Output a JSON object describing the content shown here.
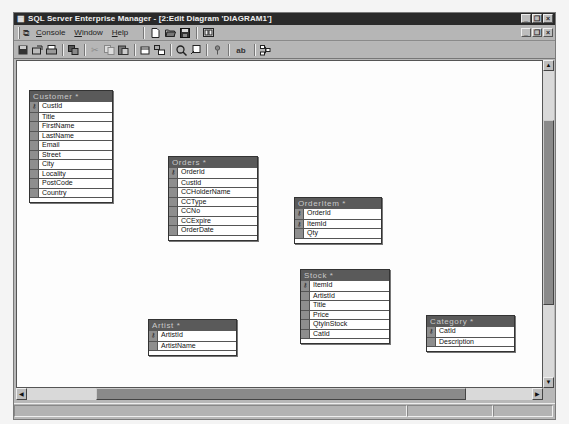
{
  "window": {
    "title": "SQL Server Enterprise Manager - [2:Edit Diagram 'DIAGRAM1']",
    "controls": [
      "minimize",
      "restore",
      "close"
    ]
  },
  "menubar": {
    "items": [
      {
        "label": "Console",
        "underline": "C"
      },
      {
        "label": "Window",
        "underline": "W"
      },
      {
        "label": "Help",
        "underline": "H"
      }
    ],
    "icons": [
      "new-icon",
      "open-icon",
      "save-icon",
      "properties-icon"
    ]
  },
  "toolbar": {
    "icons": [
      "save-diagram-icon",
      "print-setup-icon",
      "print-icon",
      "copy-diagram-icon",
      "cut-icon",
      "copy-icon",
      "paste-icon",
      "new-table-icon",
      "add-table-icon",
      "zoom-icon",
      "layout-icon",
      "set-primary-key-icon",
      "new-text-annotation-icon",
      "arrange-tables-icon"
    ]
  },
  "tables": [
    {
      "name": "Customer *",
      "x": 12,
      "y": 29,
      "w": 84,
      "columns": [
        {
          "name": "CustId",
          "key": true
        },
        {
          "name": "Title",
          "key": false
        },
        {
          "name": "FirstName",
          "key": false
        },
        {
          "name": "LastName",
          "key": false
        },
        {
          "name": "Email",
          "key": false
        },
        {
          "name": "Street",
          "key": false
        },
        {
          "name": "City",
          "key": false
        },
        {
          "name": "Locality",
          "key": false
        },
        {
          "name": "PostCode",
          "key": false
        },
        {
          "name": "Country",
          "key": false
        }
      ]
    },
    {
      "name": "Orders *",
      "x": 151,
      "y": 95,
      "w": 90,
      "columns": [
        {
          "name": "OrderId",
          "key": true
        },
        {
          "name": "CustId",
          "key": false
        },
        {
          "name": "CCHolderName",
          "key": false
        },
        {
          "name": "CCType",
          "key": false
        },
        {
          "name": "CCNo",
          "key": false
        },
        {
          "name": "CCExpire",
          "key": false
        },
        {
          "name": "OrderDate",
          "key": false
        }
      ]
    },
    {
      "name": "OrderItem *",
      "x": 277,
      "y": 136,
      "w": 88,
      "columns": [
        {
          "name": "OrderId",
          "key": true
        },
        {
          "name": "ItemId",
          "key": true
        },
        {
          "name": "Qty",
          "key": false
        }
      ]
    },
    {
      "name": "Stock *",
      "x": 283,
      "y": 208,
      "w": 90,
      "columns": [
        {
          "name": "ItemId",
          "key": true
        },
        {
          "name": "ArtistId",
          "key": false
        },
        {
          "name": "Title",
          "key": false
        },
        {
          "name": "Price",
          "key": false
        },
        {
          "name": "QtyInStock",
          "key": false
        },
        {
          "name": "CatId",
          "key": false
        }
      ]
    },
    {
      "name": "Artist *",
      "x": 131,
      "y": 258,
      "w": 89,
      "columns": [
        {
          "name": "ArtistId",
          "key": true
        },
        {
          "name": "ArtistName",
          "key": false
        }
      ]
    },
    {
      "name": "Category *",
      "x": 409,
      "y": 254,
      "w": 89,
      "columns": [
        {
          "name": "CatId",
          "key": true
        },
        {
          "name": "Description",
          "key": false
        }
      ]
    }
  ],
  "scrollbars": {
    "vertical": {
      "up": "▲",
      "down": "▼"
    },
    "horizontal": {
      "left": "◀",
      "right": "▶"
    }
  },
  "statusbar": {
    "panes": [
      "",
      "",
      ""
    ]
  }
}
